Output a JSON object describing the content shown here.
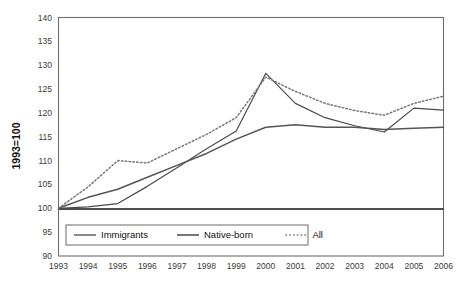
{
  "chart_data": {
    "type": "line",
    "title": "",
    "xlabel": "",
    "ylabel": "1993=100",
    "ylim": [
      90,
      140
    ],
    "ytick_step": 5,
    "yticks": [
      90,
      95,
      100,
      105,
      110,
      115,
      120,
      125,
      130,
      135,
      140
    ],
    "categories": [
      1993,
      1994,
      1995,
      1996,
      1997,
      1998,
      1999,
      2000,
      2001,
      2002,
      2003,
      2004,
      2005,
      2006
    ],
    "x": [
      "1993",
      "1994",
      "1995",
      "1996",
      "1997",
      "1998",
      "1999",
      "2000",
      "2001",
      "2002",
      "2003",
      "2004",
      "2005",
      "2006"
    ],
    "grid": false,
    "legend_position": "bottom-inside-left",
    "baseline_value": 100,
    "series": [
      {
        "name": "Immigrants",
        "style": "solid",
        "values": [
          100,
          100.3,
          101.0,
          104.6,
          108.5,
          112.5,
          116.2,
          128.3,
          122.0,
          119.0,
          117.3,
          116.0,
          121.0,
          120.6
        ]
      },
      {
        "name": "Native-born",
        "style": "solid",
        "values": [
          100,
          102.3,
          104.0,
          106.5,
          109.0,
          111.5,
          114.5,
          117.0,
          117.5,
          117.0,
          117.0,
          116.5,
          116.8,
          117.0
        ]
      },
      {
        "name": "All",
        "style": "dotted",
        "values": [
          100,
          104.5,
          110.0,
          109.5,
          112.5,
          115.5,
          119.0,
          127.5,
          124.5,
          122.0,
          120.5,
          119.5,
          122.0,
          123.5
        ]
      }
    ]
  },
  "axis": {
    "y_title": "1993=100"
  },
  "legend": {
    "items": [
      {
        "label": "Immigrants",
        "style": "solid"
      },
      {
        "label": "Native-born",
        "style": "solid"
      },
      {
        "label": "All",
        "style": "dotted"
      }
    ]
  },
  "colors": {
    "line_immigrants": "#4a4a4a",
    "line_native_born": "#555555",
    "line_all": "#777777",
    "frame": "#6e6e6e",
    "baseline": "#111111",
    "tick_text": "#3a3a3a"
  }
}
